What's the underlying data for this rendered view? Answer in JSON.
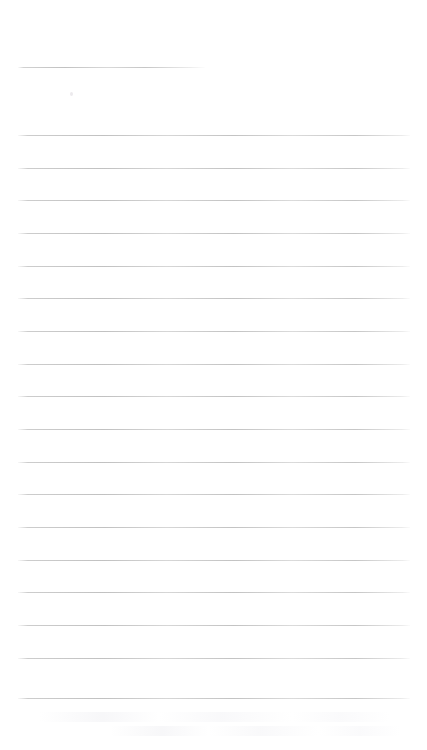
{
  "document": {
    "kind": "lined-note-page",
    "title_text": "",
    "body_text": "",
    "background_color": "#ffffff",
    "rule_color": "#b0b0b0",
    "page_width": 427,
    "page_height": 750
  },
  "layout": {
    "left_margin": 18,
    "right_edge": 410,
    "short_rule_right_edge": 205,
    "first_rule_y": 67,
    "body_first_rule_y": 135,
    "rule_spacing": 32.6
  },
  "rules": [
    {
      "name": "title-rule",
      "y": 67,
      "x1": 18,
      "x2": 205,
      "short": true,
      "text": ""
    },
    {
      "name": "body-rule-1",
      "y": 135,
      "x1": 18,
      "x2": 410,
      "short": false,
      "text": ""
    },
    {
      "name": "body-rule-2",
      "y": 168,
      "x1": 18,
      "x2": 410,
      "short": false,
      "text": ""
    },
    {
      "name": "body-rule-3",
      "y": 200,
      "x1": 18,
      "x2": 410,
      "short": false,
      "text": ""
    },
    {
      "name": "body-rule-4",
      "y": 233,
      "x1": 18,
      "x2": 410,
      "short": false,
      "text": ""
    },
    {
      "name": "body-rule-5",
      "y": 266,
      "x1": 18,
      "x2": 410,
      "short": false,
      "text": ""
    },
    {
      "name": "body-rule-6",
      "y": 298,
      "x1": 18,
      "x2": 410,
      "short": false,
      "text": ""
    },
    {
      "name": "body-rule-7",
      "y": 331,
      "x1": 18,
      "x2": 410,
      "short": false,
      "text": ""
    },
    {
      "name": "body-rule-8",
      "y": 364,
      "x1": 18,
      "x2": 410,
      "short": false,
      "text": ""
    },
    {
      "name": "body-rule-9",
      "y": 396,
      "x1": 18,
      "x2": 410,
      "short": false,
      "text": ""
    },
    {
      "name": "body-rule-10",
      "y": 429,
      "x1": 18,
      "x2": 410,
      "short": false,
      "text": ""
    },
    {
      "name": "body-rule-11",
      "y": 462,
      "x1": 18,
      "x2": 410,
      "short": false,
      "text": ""
    },
    {
      "name": "body-rule-12",
      "y": 494,
      "x1": 18,
      "x2": 410,
      "short": false,
      "text": ""
    },
    {
      "name": "body-rule-13",
      "y": 527,
      "x1": 18,
      "x2": 410,
      "short": false,
      "text": ""
    },
    {
      "name": "body-rule-14",
      "y": 560,
      "x1": 18,
      "x2": 410,
      "short": false,
      "text": ""
    },
    {
      "name": "body-rule-15",
      "y": 592,
      "x1": 18,
      "x2": 410,
      "short": false,
      "text": ""
    },
    {
      "name": "body-rule-16",
      "y": 625,
      "x1": 18,
      "x2": 410,
      "short": false,
      "text": ""
    },
    {
      "name": "body-rule-17",
      "y": 658,
      "x1": 18,
      "x2": 410,
      "short": false,
      "text": ""
    },
    {
      "name": "body-rule-18",
      "y": 698,
      "x1": 18,
      "x2": 410,
      "short": false,
      "text": ""
    }
  ],
  "artifacts": {
    "specks": [
      {
        "name": "scan-speck-1",
        "x": 70,
        "y": 92
      }
    ],
    "smudges": [
      {
        "name": "scan-smudge-1",
        "x": 40,
        "y": 712,
        "width": 350
      },
      {
        "name": "scan-smudge-2",
        "x": 110,
        "y": 726,
        "width": 290
      }
    ]
  }
}
